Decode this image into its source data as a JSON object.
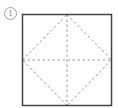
{
  "figure": {
    "label": "1",
    "square": {
      "x": 22.5,
      "y": 14.5,
      "size": 89,
      "stroke": "#444444"
    },
    "fold_lines": {
      "stroke": "#999999",
      "style": "dashed",
      "lines": [
        {
          "name": "diamond-top-right",
          "from": "top-mid",
          "to": "right-mid"
        },
        {
          "name": "diamond-right-bottom",
          "from": "right-mid",
          "to": "bottom-mid"
        },
        {
          "name": "diamond-bottom-left",
          "from": "bottom-mid",
          "to": "left-mid"
        },
        {
          "name": "diamond-left-top",
          "from": "left-mid",
          "to": "top-mid"
        },
        {
          "name": "vertical-center",
          "from": "top-mid",
          "to": "bottom-mid"
        },
        {
          "name": "horizontal-center",
          "from": "left-mid",
          "to": "right-mid"
        }
      ]
    }
  }
}
